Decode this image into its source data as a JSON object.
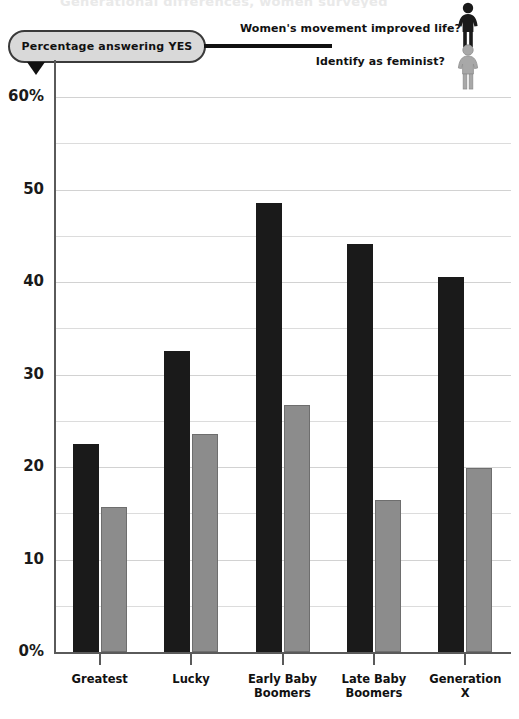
{
  "title_cut": "Generational differences, women surveyed",
  "callout": {
    "label": "Percentage answering YES"
  },
  "legend": {
    "items": [
      {
        "label": "Women's movement improved life?",
        "icon": "woman-figure-icon",
        "color": "#1a1a1a"
      },
      {
        "label": "Identify as feminist?",
        "icon": "woman-figure-icon",
        "color": "#a8a8a8"
      }
    ]
  },
  "axis": {
    "y_labels": [
      "60%",
      "50",
      "40",
      "30",
      "20",
      "10",
      "0%"
    ],
    "y_values": [
      60,
      50,
      40,
      30,
      20,
      10,
      0
    ]
  },
  "chart_data": {
    "type": "bar",
    "title": "Percentage answering YES",
    "xlabel": "",
    "ylabel": "",
    "ylim": [
      0,
      60
    ],
    "ytick_values": [
      0,
      10,
      20,
      30,
      40,
      50,
      60
    ],
    "ytick_labels": [
      "0%",
      "10",
      "20",
      "30",
      "40",
      "50",
      "60%"
    ],
    "gridlines": [
      0,
      5,
      10,
      15,
      20,
      25,
      30,
      35,
      40,
      45,
      50,
      55,
      60
    ],
    "grid": true,
    "legend_position": "top-right",
    "categories": [
      "Greatest",
      "Lucky",
      "Early Baby Boomers",
      "Late Baby Boomers",
      "Generation X"
    ],
    "category_lines": [
      [
        "Greatest"
      ],
      [
        "Lucky"
      ],
      [
        "Early Baby",
        "Boomers"
      ],
      [
        "Late Baby",
        "Boomers"
      ],
      [
        "Generation",
        "X"
      ]
    ],
    "series": [
      {
        "name": "Women's movement improved life?",
        "color": "#1a1a1a",
        "values": [
          22.5,
          32.5,
          48.5,
          44.1,
          40.5
        ]
      },
      {
        "name": "Identify as feminist?",
        "color": "#8c8c8c",
        "values": [
          15.7,
          23.6,
          26.7,
          16.4,
          19.9
        ]
      }
    ]
  }
}
